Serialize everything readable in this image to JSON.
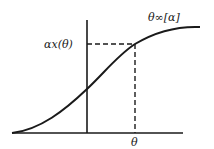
{
  "diagram": {
    "type": "sigmoid-curve-plot",
    "curve_label": "θ∞[α]",
    "y_marker_label": "αx(θ)",
    "x_marker_label": "θ",
    "colors": {
      "line": "#1a1a1a",
      "background": "#ffffff"
    }
  }
}
